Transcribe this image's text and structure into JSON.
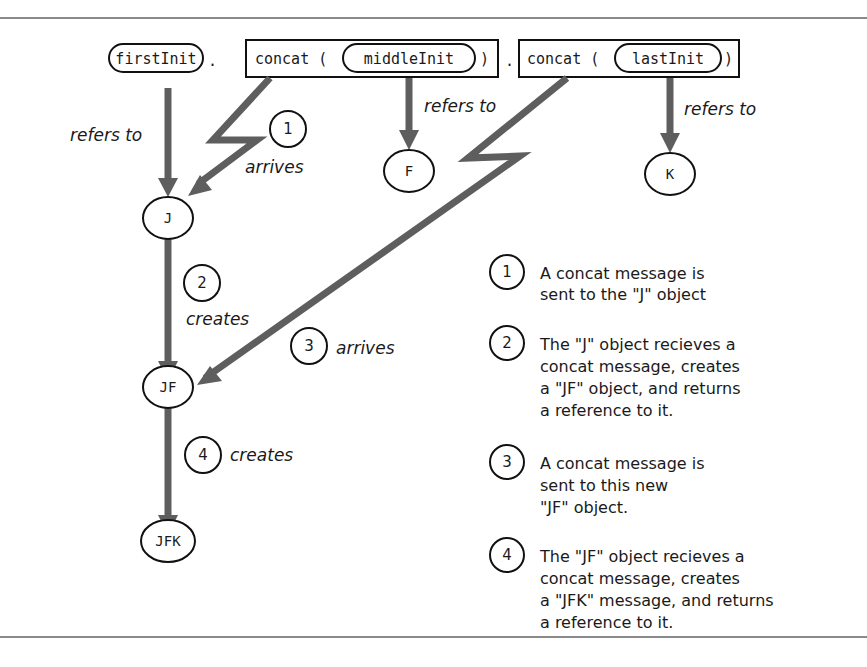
{
  "expression": {
    "first_var": "firstInit",
    "dot1": ".",
    "call1_method": "concat (",
    "call1_arg": "middleInit",
    "call1_close": ")",
    "dot2": ".",
    "call2_method": "concat (",
    "call2_arg": "lastInit",
    "call2_close": ")"
  },
  "nodes": {
    "j": "J",
    "f": "F",
    "k": "K",
    "jf": "JF",
    "jfk": "JFK"
  },
  "edge_labels": {
    "refers_to_first": "refers to",
    "refers_to_middle": "refers to",
    "refers_to_last": "refers to",
    "step1_num": "1",
    "step1_label": "arrives",
    "step2_num": "2",
    "step2_label": "creates",
    "step3_num": "3",
    "step3_label": "arrives",
    "step4_num": "4",
    "step4_label": "creates"
  },
  "legend": [
    {
      "num": "1",
      "lines": [
        "A concat message is",
        "sent to the \"J\" object"
      ]
    },
    {
      "num": "2",
      "lines": [
        "The \"J\" object recieves a",
        "concat message, creates",
        "a \"JF\" object, and returns",
        "a reference to it."
      ]
    },
    {
      "num": "3",
      "lines": [
        "A concat message is",
        "sent to this new",
        "\"JF\" object."
      ]
    },
    {
      "num": "4",
      "lines": [
        "The \"JF\" object recieves a",
        "concat message, creates",
        "a \"JFK\" message, and returns",
        "a reference to it."
      ]
    }
  ],
  "colors": {
    "arrow": "#5e5e5e",
    "outline": "#111111",
    "rule": "#8a8a8a"
  }
}
